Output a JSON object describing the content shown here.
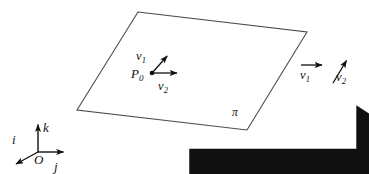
{
  "figure": {
    "stroke_color": "#3a3a3a",
    "text_color": "#111111",
    "background": "#ffffff"
  },
  "plane": {
    "label": "π",
    "corners": [
      {
        "x": 138,
        "y": 12
      },
      {
        "x": 307,
        "y": 32
      },
      {
        "x": 247,
        "y": 130
      },
      {
        "x": 77,
        "y": 110
      }
    ]
  },
  "point": {
    "label": "P",
    "subscript": "0",
    "x": 152,
    "y": 73
  },
  "in_plane_vectors": [
    {
      "name": "v",
      "subscript": "1",
      "label_x": 137,
      "label_y": 50,
      "from": {
        "x": 152,
        "y": 73
      },
      "to": {
        "x": 169,
        "y": 54
      }
    },
    {
      "name": "v",
      "subscript": "2",
      "label_x": 158,
      "label_y": 80,
      "from": {
        "x": 152,
        "y": 73
      },
      "to": {
        "x": 180,
        "y": 73
      }
    }
  ],
  "free_vectors": [
    {
      "name": "v",
      "subscript": "1",
      "label_x": 299,
      "label_y": 70,
      "from": {
        "x": 301,
        "y": 65
      },
      "to": {
        "x": 326,
        "y": 65
      }
    },
    {
      "name": "v",
      "subscript": "2",
      "label_x": 336,
      "label_y": 72,
      "from": {
        "x": 333,
        "y": 83
      },
      "to": {
        "x": 349,
        "y": 57
      }
    }
  ],
  "axes": {
    "origin": {
      "label": "O",
      "x": 38,
      "y": 152
    },
    "vectors": [
      {
        "name": "i",
        "label_x": 13,
        "label_y": 134,
        "from": {
          "x": 38,
          "y": 152
        },
        "to": {
          "x": 13,
          "y": 167
        }
      },
      {
        "name": "j",
        "label_x": 55,
        "label_y": 161,
        "from": {
          "x": 38,
          "y": 152
        },
        "to": {
          "x": 67,
          "y": 152
        }
      },
      {
        "name": "k",
        "label_x": 44,
        "label_y": 120,
        "from": {
          "x": 38,
          "y": 152
        },
        "to": {
          "x": 38,
          "y": 121
        }
      }
    ]
  }
}
